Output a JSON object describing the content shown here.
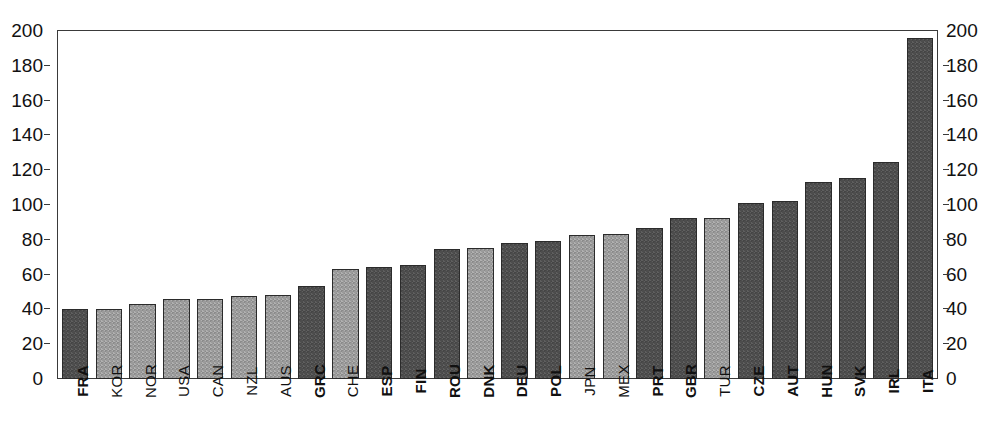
{
  "chart_data": {
    "type": "bar",
    "title": "",
    "xlabel": "",
    "ylabel": "",
    "ylim": [
      0,
      200
    ],
    "y_ticks": [
      0,
      20,
      40,
      60,
      80,
      100,
      120,
      140,
      160,
      180,
      200
    ],
    "grid": false,
    "legend": "none",
    "dual_y_axis": true,
    "categories": [
      "FRA",
      "KOR",
      "NOR",
      "USA",
      "CAN",
      "NZL",
      "AUS",
      "GRC",
      "CHE",
      "ESP",
      "FIN",
      "ROU",
      "DNK",
      "DEU",
      "POL",
      "JPN",
      "MEX",
      "PRT",
      "GBR",
      "TUR",
      "CZE",
      "AUT",
      "HUN",
      "SVK",
      "IRL",
      "ITA"
    ],
    "values": [
      40,
      40.5,
      43,
      46,
      46,
      47.5,
      48,
      53.5,
      63.5,
      64.5,
      65.5,
      75,
      75.5,
      78,
      79.5,
      82.5,
      83.5,
      87,
      92.5,
      92.5,
      101,
      102.5,
      113,
      115.5,
      124.5,
      196
    ],
    "bar_styles": [
      "dark",
      "light",
      "light",
      "light",
      "light",
      "light",
      "light",
      "dark",
      "light",
      "dark",
      "dark",
      "dark",
      "light",
      "dark",
      "dark",
      "light",
      "light",
      "dark",
      "dark",
      "light",
      "dark",
      "dark",
      "dark",
      "dark",
      "dark",
      "dark"
    ],
    "label_weights": [
      "bold",
      "normal",
      "normal",
      "normal",
      "normal",
      "normal",
      "normal",
      "bold",
      "normal",
      "bold",
      "bold",
      "bold",
      "bold",
      "bold",
      "bold",
      "normal",
      "normal",
      "bold",
      "bold",
      "normal",
      "bold",
      "bold",
      "bold",
      "bold",
      "bold",
      "bold"
    ],
    "colors": {
      "bar_dark": "#4d4d4d",
      "bar_light": "#9b9b9b",
      "bar_outline": "#2b2b2b",
      "axis": "#3a3a3a",
      "background": "#ffffff",
      "text": "#111111"
    }
  },
  "axis": {
    "left_ticks": [
      "200",
      "180",
      "160",
      "140",
      "120",
      "100",
      "80",
      "60",
      "40",
      "20",
      "0"
    ],
    "right_ticks": [
      "200",
      "180",
      "160",
      "140",
      "120",
      "100",
      "80",
      "60",
      "40",
      "20",
      "0"
    ]
  },
  "header": {
    "cropped_title": ""
  }
}
